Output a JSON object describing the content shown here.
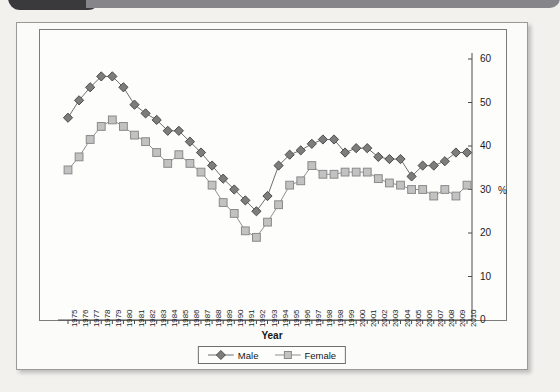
{
  "window": {
    "tab_icon": "dark-rounded-tab",
    "bar_color": "#86868a",
    "tab_color": "#3a3a3c"
  },
  "figure": {
    "background": "#fbfbfa",
    "border_color": "#9a9a96"
  },
  "chart_data": {
    "type": "line",
    "title": "",
    "subtitle": "",
    "xlabel": "Year",
    "ylabel": "%",
    "ylim": [
      0,
      60
    ],
    "yticks": [
      0,
      10,
      20,
      30,
      40,
      50,
      60
    ],
    "ytick_labels": [
      "0",
      "10",
      "20",
      "30",
      "40",
      "50",
      "60"
    ],
    "percent_symbol": "%",
    "percent_symbol_at": 30,
    "y_axis_position": "right",
    "grid": false,
    "legend_position": "bottom",
    "x": [
      1975,
      1976,
      1977,
      1978,
      1979,
      1980,
      1981,
      1982,
      1983,
      1984,
      1985,
      1986,
      1987,
      1988,
      1989,
      1990,
      1991,
      1992,
      1993,
      1994,
      1995,
      1996,
      1997,
      1998,
      1998,
      1999,
      2000,
      2001,
      2002,
      2003,
      2004,
      2005,
      2006,
      2007,
      2008,
      2009,
      2010
    ],
    "categories": [
      "1975",
      "1976",
      "1977",
      "1978",
      "1979",
      "1980",
      "1981",
      "1982",
      "1983",
      "1984",
      "1985",
      "1986",
      "1987",
      "1988",
      "1989",
      "1990",
      "1991",
      "1992",
      "1993",
      "1994",
      "1995",
      "1996",
      "1997",
      "1998",
      "1998",
      "1999",
      "2000",
      "2001",
      "2002",
      "2003",
      "2004",
      "2005",
      "2006",
      "2007",
      "2008",
      "2009",
      "2010"
    ],
    "series": [
      {
        "name": "Male",
        "marker": "diamond",
        "color": "#7d7d7d",
        "edge_color": "#4c4c4c",
        "line_color": "#6f6f6f",
        "values": [
          46.5,
          50.5,
          53.5,
          56.0,
          56.0,
          53.5,
          49.5,
          47.5,
          46.0,
          43.5,
          43.5,
          41.0,
          38.5,
          35.5,
          32.5,
          30.0,
          27.5,
          25.0,
          28.5,
          35.5,
          38.0,
          39.0,
          40.5,
          41.5,
          41.5,
          38.5,
          39.5,
          39.5,
          37.5,
          37.0,
          37.0,
          33.0,
          35.5,
          35.5,
          36.5,
          38.5,
          38.5
        ]
      },
      {
        "name": "Female",
        "marker": "square",
        "color": "#c2c2c2",
        "edge_color": "#8a8a8a",
        "line_color": "#8f8f8f",
        "values": [
          34.5,
          37.5,
          41.5,
          44.5,
          46.0,
          44.5,
          42.5,
          41.0,
          38.5,
          36.0,
          38.0,
          36.0,
          34.0,
          31.0,
          27.0,
          24.5,
          20.5,
          19.0,
          22.5,
          26.5,
          31.0,
          32.0,
          35.5,
          33.5,
          33.5,
          34.0,
          34.0,
          34.0,
          32.5,
          31.5,
          31.0,
          30.0,
          30.0,
          28.5,
          30.0,
          28.5,
          31.0
        ]
      }
    ]
  },
  "legend": {
    "entries": [
      {
        "label": "Male",
        "marker": "diamond"
      },
      {
        "label": "Female",
        "marker": "square"
      }
    ]
  }
}
